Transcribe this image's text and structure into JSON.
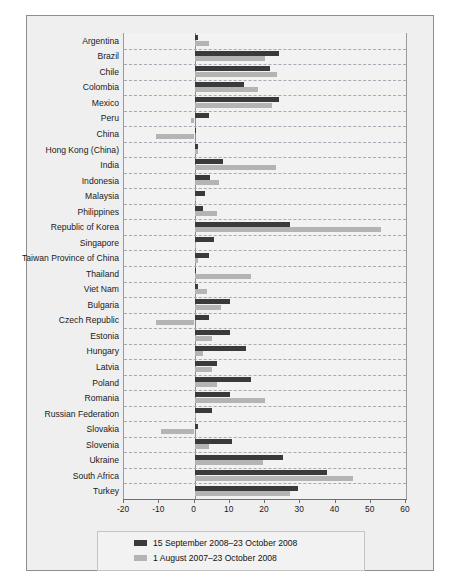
{
  "chart_data": {
    "type": "bar",
    "orientation": "horizontal",
    "title": "",
    "xlabel": "",
    "ylabel": "",
    "xlim": [
      -20,
      60
    ],
    "xticks": [
      -20,
      -10,
      0,
      10,
      20,
      30,
      40,
      50,
      60
    ],
    "grid": true,
    "legend_position": "bottom",
    "categories": [
      "Argentina",
      "Brazil",
      "Chile",
      "Colombia",
      "Mexico",
      "Peru",
      "China",
      "Hong Kong (China)",
      "India",
      "Indonesia",
      "Malaysia",
      "Philippines",
      "Republic of Korea",
      "Singapore",
      "Taiwan Province of China",
      "Thailand",
      "Viet Nam",
      "Bulgaria",
      "Czech Republic",
      "Estonia",
      "Hungary",
      "Latvia",
      "Poland",
      "Romania",
      "Russian Federation",
      "Slovakia",
      "Slovenia",
      "Ukraine",
      "South Africa",
      "Turkey"
    ],
    "series": [
      {
        "name": "15 September 2008–23 October 2008",
        "color": "#3a3a3a",
        "values": [
          1,
          24,
          21.5,
          14,
          24,
          4,
          0,
          1,
          8,
          4.5,
          3,
          2.5,
          27,
          5.5,
          4,
          0.5,
          1,
          10,
          4,
          10,
          14.5,
          6.5,
          16,
          10,
          5,
          1,
          10.5,
          25,
          37.5,
          29.5
        ]
      },
      {
        "name": "1 August 2007–23 October 2008",
        "color": "#b4b4b4",
        "values": [
          4,
          20,
          23.5,
          18,
          22,
          -1,
          -11,
          1,
          23,
          7,
          0,
          6.5,
          53,
          0,
          1,
          16,
          3.5,
          7.5,
          -11,
          5,
          2.5,
          5,
          6.5,
          20,
          0.5,
          -9.5,
          4,
          19.5,
          45,
          27
        ]
      }
    ]
  },
  "legend": {
    "entries": [
      {
        "label": "15 September 2008–23 October 2008",
        "swatch": "dark"
      },
      {
        "label": "1 August 2007–23 October 2008",
        "swatch": "light"
      }
    ]
  }
}
